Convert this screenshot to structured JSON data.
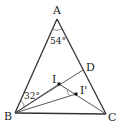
{
  "diagram": {
    "type": "geometry-triangle",
    "points": {
      "A": {
        "label": "A",
        "x": 57,
        "y": 19
      },
      "B": {
        "label": "B",
        "x": 15,
        "y": 113
      },
      "C": {
        "label": "C",
        "x": 106,
        "y": 114
      },
      "D": {
        "label": "D",
        "x": 83,
        "y": 70
      },
      "I": {
        "label": "I",
        "x": 59,
        "y": 84
      },
      "I2": {
        "label": "I'",
        "x": 76,
        "y": 94
      }
    },
    "angles": {
      "A": "54°",
      "B": "32°"
    },
    "segments": [
      "AB",
      "AC",
      "BC",
      "BD",
      "BI'",
      "IC",
      "I'C"
    ],
    "colors": {
      "stroke": "#333333",
      "text": "#222222"
    }
  }
}
